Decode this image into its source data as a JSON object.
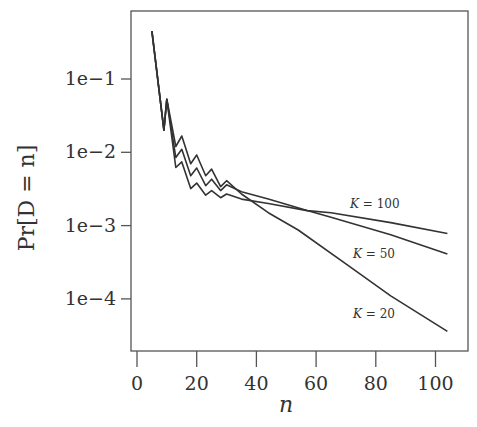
{
  "chart_data": {
    "type": "line",
    "title": "",
    "xlabel": "n",
    "ylabel": "Pr[D = n]",
    "yscale": "log",
    "xlim": [
      -1,
      110
    ],
    "ylim_log10": [
      -4.5,
      -0.2
    ],
    "x_ticks": [
      0,
      20,
      40,
      60,
      80,
      100
    ],
    "x_tick_labels": [
      "0",
      "20",
      "40",
      "60",
      "80",
      "100"
    ],
    "y_ticks_log10": [
      -1,
      -2,
      -3,
      -4
    ],
    "y_tick_labels": [
      "1e−1",
      "1e−2",
      "1e−3",
      "1e−4"
    ],
    "grid": false,
    "legend": "inline labels near curve ends",
    "series": [
      {
        "name": "K = 20",
        "label": "K = 20",
        "x": [
          5,
          9,
          10,
          13,
          15,
          18,
          20,
          23,
          25,
          28,
          30,
          35,
          44,
          54,
          70,
          85,
          104
        ],
        "values": [
          0.45,
          0.02,
          0.053,
          0.012,
          0.0167,
          0.007,
          0.0092,
          0.0048,
          0.0059,
          0.0034,
          0.0041,
          0.0027,
          0.0015,
          0.00087,
          0.0003,
          0.00011,
          3.6e-05
        ]
      },
      {
        "name": "K = 50",
        "label": "K = 50",
        "x": [
          5,
          9,
          10,
          13,
          15,
          18,
          20,
          23,
          25,
          28,
          30,
          35,
          44,
          57,
          65,
          85,
          104
        ],
        "values": [
          0.45,
          0.02,
          0.053,
          0.0085,
          0.011,
          0.0048,
          0.0061,
          0.0035,
          0.0043,
          0.003,
          0.0036,
          0.0029,
          0.0023,
          0.0016,
          0.0013,
          0.00075,
          0.00041
        ]
      },
      {
        "name": "K = 100",
        "label": "K = 100",
        "x": [
          5,
          9,
          10,
          13,
          15,
          18,
          20,
          23,
          25,
          28,
          30,
          35,
          44,
          57,
          65,
          85,
          104
        ],
        "values": [
          0.45,
          0.02,
          0.053,
          0.0062,
          0.0074,
          0.0032,
          0.0038,
          0.0026,
          0.003,
          0.0024,
          0.0027,
          0.0023,
          0.002,
          0.0016,
          0.0015,
          0.0011,
          0.00078
        ]
      }
    ]
  },
  "labels": {
    "series_label_positions": [
      {
        "series": "K = 100",
        "x": 350,
        "y": 208
      },
      {
        "series": "K = 50",
        "x": 353,
        "y": 258
      },
      {
        "series": "K = 20",
        "x": 353,
        "y": 318
      }
    ]
  },
  "colors": {
    "line": "#333333",
    "axis": "#555555",
    "background": "#ffffff"
  }
}
